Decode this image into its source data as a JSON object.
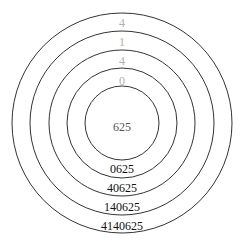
{
  "diagram": {
    "center_label": "625",
    "top_labels": [
      "0",
      "4",
      "1",
      "4"
    ],
    "bottom_labels": [
      "0625",
      "40625",
      "140625",
      "4140625"
    ],
    "colors": {
      "stroke": "#333333",
      "top_label": "#b0b0b0",
      "center_label": "#555555",
      "bottom_label": "#111111"
    }
  }
}
